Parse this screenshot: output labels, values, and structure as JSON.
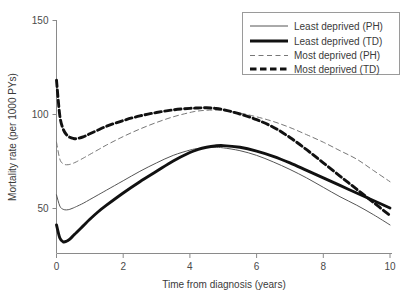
{
  "chart_data": {
    "type": "line",
    "title": "",
    "xlabel": "Time from diagnosis (years)",
    "ylabel": "Mortality rate (per 1000 PYs)",
    "xlim": [
      0,
      10
    ],
    "ylim": [
      28,
      150
    ],
    "xticks": [
      0,
      2,
      4,
      6,
      8,
      10
    ],
    "xtick_labels": [
      "0",
      "2",
      "4",
      "6",
      "8",
      "10"
    ],
    "yticks": [
      50,
      100,
      150
    ],
    "ytick_labels": [
      "50",
      "100",
      "150"
    ],
    "grid": false,
    "legend_position": "top-right",
    "x": [
      0,
      0.1,
      0.2,
      0.3,
      0.4,
      0.5,
      0.6,
      0.8,
      1,
      1.25,
      1.5,
      2,
      2.5,
      3,
      3.5,
      4,
      4.25,
      4.5,
      4.75,
      5,
      5.5,
      6,
      6.5,
      7,
      7.5,
      8,
      8.5,
      9,
      9.5,
      10
    ],
    "series": [
      {
        "name": "Least deprived (PH)",
        "style": "thin-solid",
        "color": "#555555",
        "values": [
          57,
          51,
          49.3,
          49,
          49.3,
          50,
          50.8,
          52.5,
          54.5,
          57,
          59.5,
          64.5,
          69.5,
          74,
          78,
          80.8,
          81.7,
          82.2,
          82.3,
          82,
          80.5,
          78,
          74.5,
          70.5,
          66,
          61,
          56,
          51.5,
          46.5,
          41
        ]
      },
      {
        "name": "Least deprived (TD)",
        "style": "thick-solid",
        "color": "#111111",
        "values": [
          41,
          34,
          32,
          32.3,
          33.5,
          35.2,
          37,
          40.5,
          44,
          48,
          51.5,
          58,
          64,
          69.5,
          75,
          79.5,
          81.2,
          82.3,
          83,
          83.2,
          82.3,
          80.3,
          77.5,
          74,
          70,
          66,
          62,
          58,
          54,
          50
        ]
      },
      {
        "name": "Most deprived (PH)",
        "style": "thin-dashed",
        "color": "#777777",
        "values": [
          85,
          76,
          73.5,
          73,
          73.2,
          73.8,
          74.6,
          76.5,
          78.5,
          81,
          83.5,
          88,
          92,
          95.5,
          98.5,
          100.8,
          101.6,
          102,
          102.1,
          101.8,
          100.5,
          98.5,
          96,
          92.8,
          89,
          85,
          80.5,
          76,
          70,
          64
        ]
      },
      {
        "name": "Most deprived (TD)",
        "style": "thick-dashed",
        "color": "#111111",
        "values": [
          118,
          99,
          92,
          89,
          87.6,
          87,
          86.9,
          87.8,
          89.5,
          91.5,
          93.5,
          96.5,
          99,
          100.8,
          102.2,
          103,
          103.2,
          103.3,
          103,
          102.3,
          100,
          97,
          93,
          87.5,
          81,
          74,
          67,
          60,
          53,
          46
        ]
      }
    ],
    "legend": [
      {
        "label": "Least deprived (PH)",
        "style": "thin-solid"
      },
      {
        "label": "Least deprived (TD)",
        "style": "thick-solid"
      },
      {
        "label": "Most deprived (PH)",
        "style": "thin-dashed"
      },
      {
        "label": "Most deprived (TD)",
        "style": "thick-dashed"
      }
    ]
  }
}
